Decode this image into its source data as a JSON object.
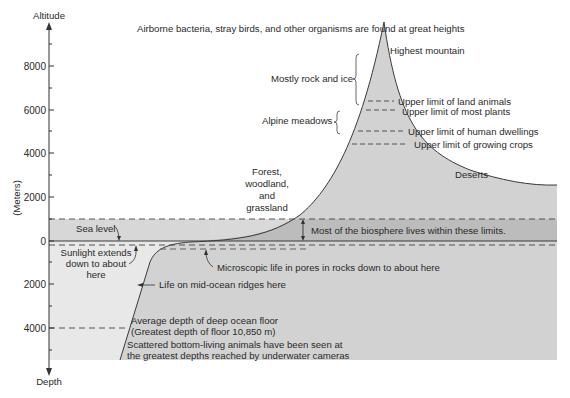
{
  "axis": {
    "top_label": "Altitude",
    "bottom_label": "Depth",
    "unit_label": "(Meters)",
    "altitude_ticks": [
      "8000",
      "6000",
      "4000",
      "2000",
      "0"
    ],
    "depth_ticks": [
      "2000",
      "4000"
    ]
  },
  "header_note": "Airborne bacteria, stray birds, and other organisms are found at great heights",
  "mountain": {
    "peak": "Highest mountain",
    "rock_ice": "Mostly rock and ice",
    "alpine": "Alpine meadows",
    "limits": [
      "Upper limit of land animals",
      "Upper limit of most plants",
      "Upper limit of human dwellings",
      "Upper limit of growing crops"
    ]
  },
  "land": {
    "forest_line1": "Forest,",
    "forest_line2": "woodland,",
    "forest_line3": "and",
    "forest_line4": "grassland",
    "deserts": "Deserts"
  },
  "sea": {
    "sea_level": "Sea level",
    "biosphere": "Most of the biosphere lives within these limits.",
    "sunlight_line1": "Sunlight extends",
    "sunlight_line2": "down to about",
    "sunlight_line3": "here",
    "microscopic": "Microscopic life in pores in rocks down to about here",
    "ridges": "Life on mid-ocean ridges here",
    "avg_depth_line1": "Average depth of deep ocean floor",
    "avg_depth_line2": "(Greatest depth of floor 10,850 m)",
    "scattered_line1": "Scattered bottom-living animals have been seen at",
    "scattered_line2": "the greatest depths reached by underwater cameras"
  },
  "colors": {
    "ocean_fill": "#e6e6e6",
    "land_fill": "#d4d4d4",
    "band_fill": "#bdbdbd",
    "line": "#3a3a3a",
    "background": "#ffffff"
  }
}
